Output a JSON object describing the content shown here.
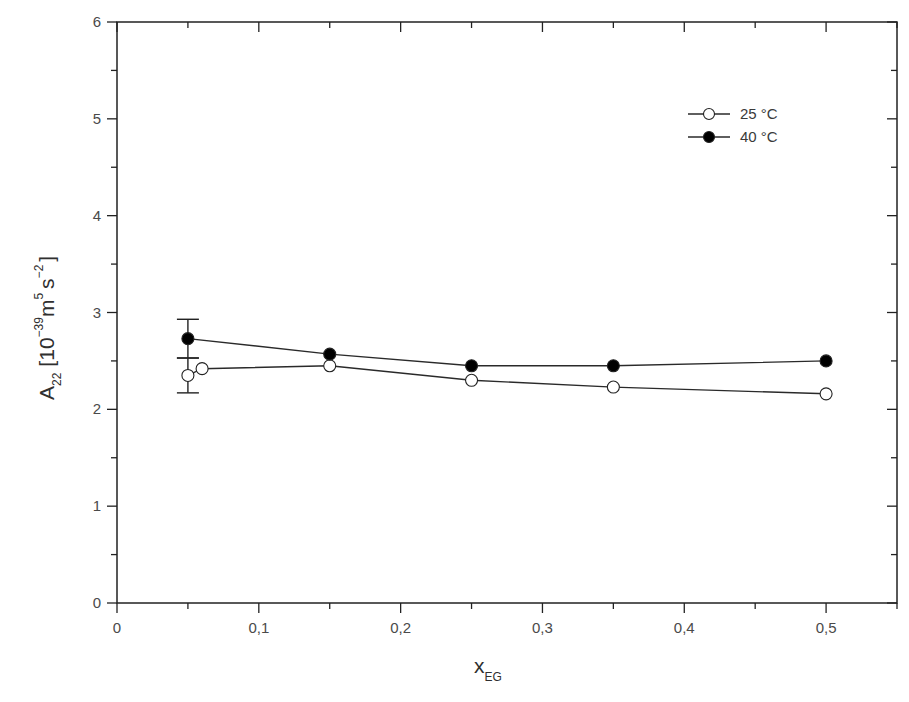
{
  "chart_data": {
    "type": "line",
    "title": "",
    "xlabel": "x_EG",
    "xlabel_main": "x",
    "xlabel_sub": "EG",
    "ylabel": "A_22 [10^-39 m^5 s^-2]",
    "ylabel_parts": {
      "A": "A",
      "A_sub": "22",
      "open": "[10",
      "exp1": "−39",
      "m": "m",
      "exp2": "5",
      "s": "s",
      "exp3": "−2",
      "close": "]"
    },
    "xlim": [
      0,
      0.55
    ],
    "ylim": [
      0,
      6
    ],
    "x_ticks": [
      0,
      0.1,
      0.2,
      0.3,
      0.4,
      0.5
    ],
    "x_tick_labels": [
      "0",
      "0,1",
      "0,2",
      "0,3",
      "0,4",
      "0,5"
    ],
    "y_ticks": [
      0,
      1,
      2,
      3,
      4,
      5,
      6
    ],
    "y_tick_labels": [
      "0",
      "1",
      "2",
      "3",
      "4",
      "5",
      "6"
    ],
    "grid": false,
    "legend_position": "upper right",
    "series": [
      {
        "name": "25 °C",
        "marker": "open-circle",
        "x": [
          0.05,
          0.06,
          0.15,
          0.25,
          0.35,
          0.5
        ],
        "values": [
          2.35,
          2.42,
          2.45,
          2.3,
          2.23,
          2.16
        ],
        "error_bars": [
          {
            "x": 0.05,
            "y": 2.35,
            "minus": 0.18,
            "plus": 0.18
          }
        ]
      },
      {
        "name": "40 °C",
        "marker": "filled-circle",
        "x": [
          0.05,
          0.15,
          0.25,
          0.35,
          0.5
        ],
        "values": [
          2.73,
          2.57,
          2.45,
          2.45,
          2.5
        ],
        "error_bars": [
          {
            "x": 0.05,
            "y": 2.73,
            "minus": 0.2,
            "plus": 0.2
          }
        ]
      }
    ]
  },
  "legend": {
    "items": [
      {
        "label": "25 °C",
        "marker": "open-circle"
      },
      {
        "label": "40 °C",
        "marker": "filled-circle"
      }
    ]
  },
  "colors": {
    "line": "#2a2a2a",
    "axis": "#222222",
    "open_fill": "#ffffff",
    "filled": "#000000"
  }
}
